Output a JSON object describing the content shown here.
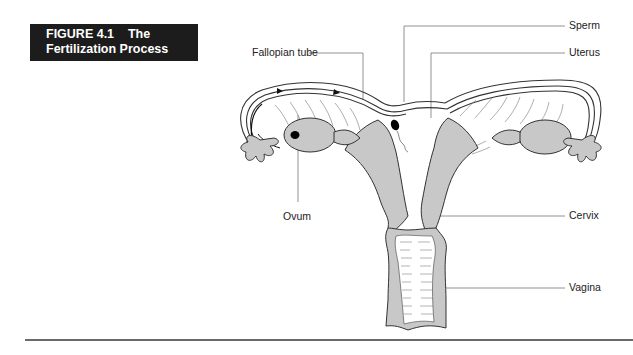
{
  "figure": {
    "number_line": "FIGURE 4.1    The",
    "title_line": "Fertilization Process"
  },
  "labels": {
    "fallopian_tube": "Fallopian tube",
    "sperm": "Sperm",
    "uterus": "Uterus",
    "ovum": "Ovum",
    "cervix": "Cervix",
    "vagina": "Vagina"
  },
  "colors": {
    "tissue_fill": "#c8c8c8",
    "outline": "#333333",
    "title_bg": "#1c1c1c",
    "leader_line": "#777777"
  }
}
